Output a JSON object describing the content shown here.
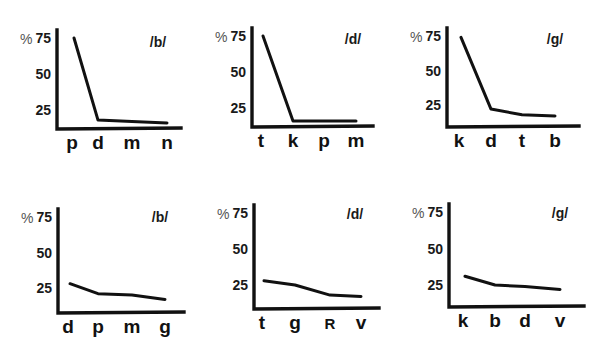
{
  "chart_data": [
    {
      "type": "line",
      "panel": "top-left",
      "title": "/b/",
      "ylabel": "%",
      "yticks": [
        25,
        50,
        75
      ],
      "ylim": [
        10,
        82
      ],
      "categories": [
        "p",
        "d",
        "m",
        "n"
      ],
      "values": [
        75,
        18,
        17,
        16
      ],
      "grid": false
    },
    {
      "type": "line",
      "panel": "top-middle",
      "title": "/d/",
      "ylabel": "%",
      "yticks": [
        25,
        50,
        75
      ],
      "ylim": [
        10,
        82
      ],
      "categories": [
        "t",
        "k",
        "p",
        "m"
      ],
      "values": [
        75,
        16,
        16,
        16
      ],
      "grid": false
    },
    {
      "type": "line",
      "panel": "top-right",
      "title": "/g/",
      "ylabel": "%",
      "yticks": [
        25,
        50,
        75
      ],
      "ylim": [
        10,
        82
      ],
      "categories": [
        "k",
        "d",
        "t",
        "b"
      ],
      "values": [
        74,
        22,
        18,
        17
      ],
      "grid": false
    },
    {
      "type": "line",
      "panel": "bottom-left",
      "title": "/b/",
      "ylabel": "%",
      "yticks": [
        25,
        50,
        75
      ],
      "ylim": [
        10,
        82
      ],
      "categories": [
        "d",
        "p",
        "m",
        "g"
      ],
      "values": [
        28,
        21,
        20,
        17
      ],
      "grid": false
    },
    {
      "type": "line",
      "panel": "bottom-middle",
      "title": "/d/",
      "ylabel": "%",
      "yticks": [
        25,
        50,
        75
      ],
      "ylim": [
        10,
        82
      ],
      "categories": [
        "t",
        "g",
        "R",
        "v"
      ],
      "values": [
        28,
        25,
        18,
        17
      ],
      "grid": false
    },
    {
      "type": "line",
      "panel": "bottom-right",
      "title": "/g/",
      "ylabel": "%",
      "yticks": [
        25,
        50,
        75
      ],
      "ylim": [
        10,
        82
      ],
      "categories": [
        "k",
        "b",
        "d",
        "v"
      ],
      "values": [
        31,
        25,
        24,
        22
      ],
      "grid": false
    }
  ],
  "layout": {
    "panels": [
      {
        "axis_x": 57,
        "axis_bottom": 129,
        "axis_right": 181,
        "y75": 38,
        "y25": 110,
        "title_x": 158,
        "title_y": 47,
        "xpos": [
          72,
          98,
          132,
          167
        ]
      },
      {
        "axis_x": 252,
        "axis_bottom": 127,
        "axis_right": 373,
        "y75": 36,
        "y25": 108,
        "title_x": 353,
        "title_y": 44,
        "xpos": [
          261,
          293,
          324,
          356
        ]
      },
      {
        "axis_x": 447,
        "axis_bottom": 127,
        "axis_right": 579,
        "y75": 36,
        "y25": 105,
        "title_x": 555,
        "title_y": 44,
        "xpos": [
          459,
          491,
          522,
          555
        ]
      },
      {
        "axis_x": 58,
        "axis_bottom": 313,
        "axis_right": 184,
        "y75": 217,
        "y25": 288,
        "title_x": 160,
        "title_y": 222,
        "xpos": [
          68,
          98,
          132,
          165
        ]
      },
      {
        "axis_x": 254,
        "axis_bottom": 309,
        "axis_right": 379,
        "y75": 213,
        "y25": 285,
        "title_x": 355,
        "title_y": 219,
        "xpos": [
          262,
          295,
          330,
          361
        ]
      },
      {
        "axis_x": 449,
        "axis_bottom": 307,
        "axis_right": 584,
        "y75": 212,
        "y25": 285,
        "title_x": 560,
        "title_y": 218,
        "xpos": [
          463,
          495,
          525,
          560
        ]
      }
    ]
  }
}
